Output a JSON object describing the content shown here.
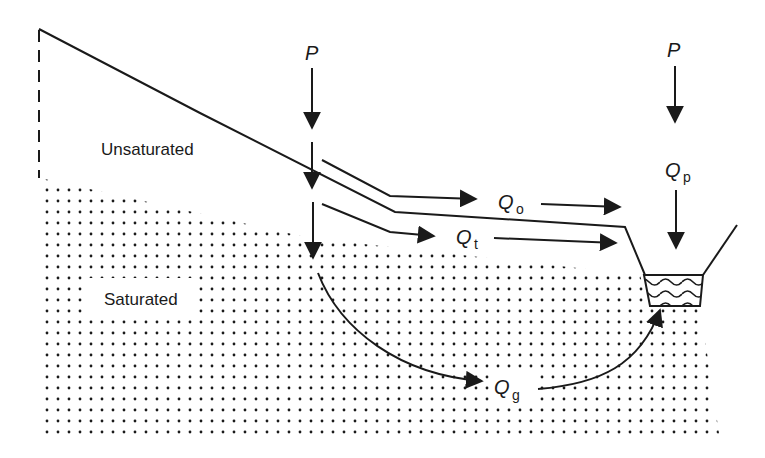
{
  "diagram": {
    "zones": {
      "unsaturated": "Unsaturated",
      "saturated": "Saturated"
    },
    "labels": {
      "precip_left": "P",
      "precip_right": "P",
      "overland_flow": {
        "main": "Q",
        "sub": "o"
      },
      "throughflow": {
        "main": "Q",
        "sub": "t"
      },
      "groundwater_flow": {
        "main": "Q",
        "sub": "g"
      },
      "channel_precip": {
        "main": "Q",
        "sub": "p"
      }
    },
    "colors": {
      "ink": "#1a1a1a",
      "background": "#ffffff"
    }
  }
}
